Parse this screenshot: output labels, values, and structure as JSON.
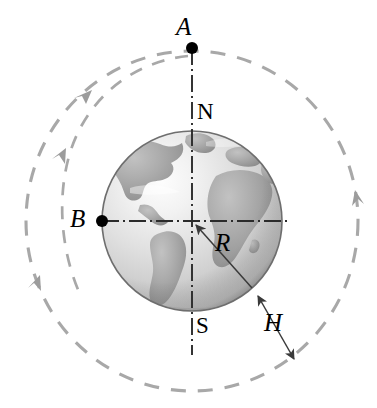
{
  "figure": {
    "background_color": "#ffffff"
  },
  "colors": {
    "orbit_dash": "#a8a8a8",
    "globe_ocean_light": "#efefef",
    "globe_ocean_mid": "#c9c9c9",
    "globe_land": "#9a9a9a",
    "globe_edge": "#6e6e6e",
    "axis_line": "#2b2b2b",
    "marker_dot": "#000000",
    "label_text": "#000000"
  },
  "labels": {
    "point_a": "A",
    "point_b": "B",
    "radius": "R",
    "altitude": "H",
    "north_pole": "N",
    "south_pole": "S"
  },
  "geometry": {
    "globe": {
      "cx": 192,
      "cy": 221,
      "r": 90
    },
    "orbit": {
      "cx": 192,
      "cy": 221,
      "rx": 166,
      "ry": 170
    },
    "point_a": {
      "x": 192,
      "y": 48
    },
    "point_b": {
      "x": 102,
      "y": 221
    },
    "radius_arrow": {
      "from_x": 252,
      "from_y": 289,
      "to_x": 192,
      "to_y": 221
    },
    "altitude_arrow": {
      "from_x": 256,
      "from_y": 294,
      "to_x": 294,
      "to_y": 360
    }
  },
  "annotations": {
    "orbit_direction": "counterclockwise-on-left / upward-on-right",
    "arrowheads": [
      {
        "name": "orbit-arrow-upper-left",
        "x": 88,
        "y": 97
      },
      {
        "name": "orbit-arrow-left",
        "x": 61,
        "y": 152
      },
      {
        "name": "orbit-arrow-lower-left",
        "x": 36,
        "y": 282
      },
      {
        "name": "orbit-arrow-right",
        "x": 356,
        "y": 198
      }
    ]
  }
}
